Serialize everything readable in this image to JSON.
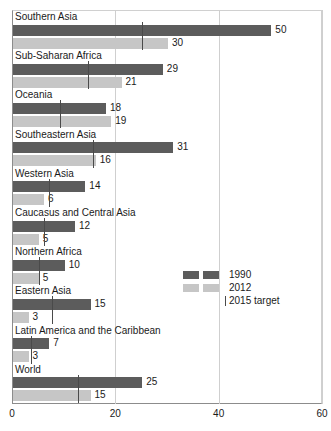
{
  "chart_data": {
    "type": "bar",
    "orientation": "horizontal",
    "title": "",
    "subtitle": "",
    "xlabel": "",
    "ylabel": "",
    "xlim": [
      0,
      60
    ],
    "xticks": [
      0,
      20,
      40,
      60
    ],
    "xtick_labels": [
      "0",
      "20",
      "40",
      "60"
    ],
    "grid": true,
    "grid_axis": "x",
    "legend_position": "center-right",
    "categories": [
      "Southern Asia",
      "Sub-Saharan Africa",
      "Oceania",
      "Southeastern Asia",
      "Western Asia",
      "Caucasus and Central Asia",
      "Northern Africa",
      "Eastern Asia",
      "Latin America and the Caribbean",
      "World"
    ],
    "series": [
      {
        "name": "1990",
        "color": "#5c5c5c",
        "values": [
          50,
          29,
          18,
          31,
          14,
          12,
          10,
          15,
          7,
          25
        ]
      },
      {
        "name": "2012",
        "color": "#c6c6c6",
        "values": [
          30,
          21,
          19,
          16,
          6,
          5,
          5,
          3,
          3,
          15
        ]
      }
    ],
    "markers": {
      "name": "2015 target",
      "color": "#4a4a4a",
      "values": [
        25,
        14.5,
        9,
        15.5,
        7,
        6,
        5,
        7.5,
        3.5,
        12.5
      ]
    },
    "value_labels": {
      "1990": [
        "50",
        "29",
        "18",
        "31",
        "14",
        "12",
        "10",
        "15",
        "7",
        "25"
      ],
      "2012": [
        "30",
        "21",
        "19",
        "16",
        "6",
        "5",
        "5",
        "3",
        "3",
        "15"
      ]
    }
  },
  "legend": {
    "entries": [
      {
        "label": "1990",
        "type": "swatch",
        "color": "#5c5c5c"
      },
      {
        "label": "2012",
        "type": "swatch",
        "color": "#c6c6c6"
      },
      {
        "label": "2015 target",
        "type": "tick",
        "color": "#4a4a4a"
      }
    ]
  }
}
